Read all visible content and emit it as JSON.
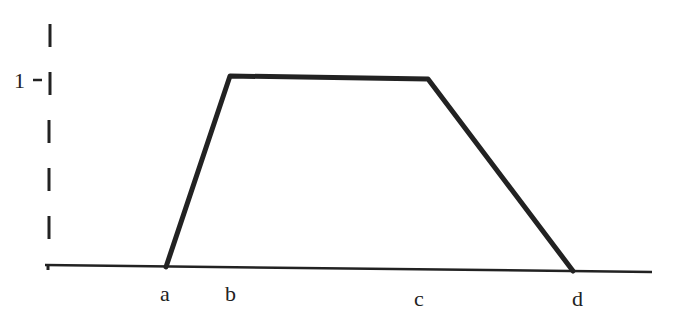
{
  "diagram": {
    "type": "trapezoidal membership function",
    "y_axis": {
      "tick_label": "1",
      "style": "dashed"
    },
    "x_axis": {
      "labels": [
        "a",
        "b",
        "c",
        "d"
      ]
    },
    "points": [
      {
        "label": "a",
        "x": 166,
        "y": 267,
        "value": 0
      },
      {
        "label": "b",
        "x": 230,
        "y": 76,
        "value": 1
      },
      {
        "label": "c",
        "x": 428,
        "y": 79,
        "value": 1
      },
      {
        "label": "d",
        "x": 573,
        "y": 271,
        "value": 0
      }
    ],
    "colors": {
      "line": "#222222",
      "background": "#ffffff"
    }
  }
}
